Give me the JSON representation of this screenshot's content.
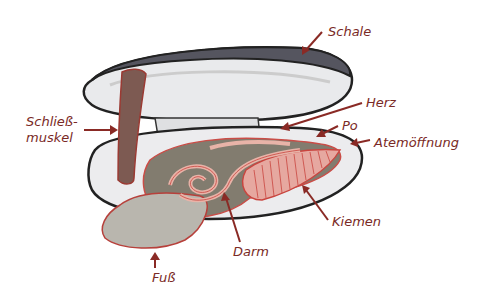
{
  "diagram": {
    "labels": {
      "schale": "Schale",
      "herz": "Herz",
      "po": "Po",
      "atemoeffnung": "Atemöffnung",
      "schliessmuskel_line1": "Schließ-",
      "schliessmuskel_line2": "muskel",
      "kiemen": "Kiemen",
      "darm": "Darm",
      "fuss": "Fuß"
    },
    "colors": {
      "label": "#7a2a26",
      "arrow": "#8a2a25",
      "shell_outline": "#222222",
      "shell_top": "#55555f",
      "shell_inner": "#e9eaec",
      "body": "#7d7769",
      "organ_outline": "#c9453f",
      "organ_fill": "#e8b3a8",
      "foot": "#b9b6ae",
      "muscle": "#7d5a52"
    }
  }
}
